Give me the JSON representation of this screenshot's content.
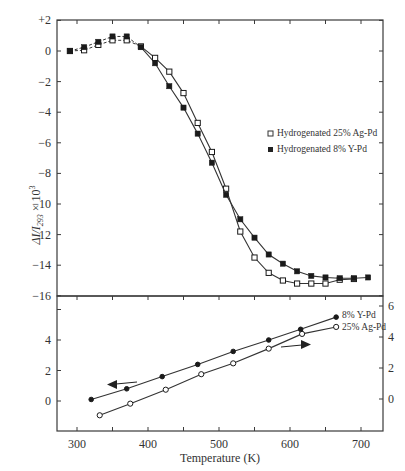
{
  "chart_data": [
    {
      "type": "line",
      "panel": "upper",
      "title": "",
      "xlabel": "Temperature (K)",
      "ylabel": "ΔI/I293 × 10^3",
      "ylim": [
        -16,
        2
      ],
      "xlim": [
        270,
        730
      ],
      "yticks": [
        "+2",
        "0",
        "−2",
        "−4",
        "−6",
        "−8",
        "−10",
        "−12",
        "−14",
        "−16"
      ],
      "ytick_values": [
        2,
        0,
        -2,
        -4,
        -6,
        -8,
        -10,
        -12,
        -14,
        -16
      ],
      "legend": {
        "position": "right-middle",
        "entries": [
          {
            "marker": "open-square",
            "label": "Hydrogenated  25% Ag-Pd"
          },
          {
            "marker": "filled-square",
            "label": "Hydrogenated   8% Y-Pd"
          }
        ]
      },
      "series": [
        {
          "name": "Hydrogenated 25% Ag-Pd",
          "marker": "open-square",
          "x": [
            290,
            310,
            330,
            350,
            370,
            390,
            410,
            430,
            450,
            470,
            490,
            510,
            530,
            550,
            570,
            590,
            610,
            630,
            650,
            670,
            690
          ],
          "y": [
            0.0,
            0.05,
            0.4,
            0.7,
            0.7,
            0.3,
            -0.45,
            -1.35,
            -2.75,
            -4.7,
            -6.6,
            -9.0,
            -11.8,
            -13.5,
            -14.5,
            -15.0,
            -15.2,
            -15.2,
            -15.2,
            -14.95,
            -14.9
          ],
          "dashed_until_x": 390
        },
        {
          "name": "Hydrogenated 8% Y-Pd",
          "marker": "filled-square",
          "x": [
            290,
            310,
            330,
            350,
            370,
            390,
            410,
            430,
            450,
            470,
            490,
            510,
            530,
            550,
            570,
            590,
            610,
            630,
            650,
            670,
            690,
            710
          ],
          "y": [
            0.0,
            0.25,
            0.6,
            0.95,
            0.95,
            0.25,
            -0.8,
            -2.3,
            -3.7,
            -5.4,
            -7.3,
            -9.4,
            -11.0,
            -12.2,
            -13.3,
            -13.9,
            -14.4,
            -14.7,
            -14.8,
            -14.85,
            -14.85,
            -14.8
          ],
          "dashed_until_x": 390
        }
      ]
    },
    {
      "type": "line",
      "panel": "lower",
      "xlabel": "Temperature (K)",
      "xticks": [
        "300",
        "400",
        "500",
        "600",
        "700"
      ],
      "xtick_values": [
        300,
        400,
        500,
        600,
        700
      ],
      "xlim": [
        270,
        730
      ],
      "left_yticks": [
        "0",
        "2",
        "4"
      ],
      "left_ytick_values": [
        0,
        2,
        4
      ],
      "right_yticks": [
        "0",
        "2",
        "4",
        "6"
      ],
      "right_ytick_values": [
        0,
        2,
        4,
        6
      ],
      "ylim_left": [
        -1.9,
        6.4
      ],
      "ylim_right": [
        -1.9,
        6.4
      ],
      "annotations": [
        {
          "text": "8% Y-Pd",
          "position": "end of upper line"
        },
        {
          "text": "25% Ag-Pd",
          "position": "end of lower line"
        },
        {
          "type": "arrow",
          "direction": "left",
          "near_series": "8% Y-Pd",
          "meaning": "cooling (left axis)"
        },
        {
          "type": "arrow",
          "direction": "right",
          "near_series": "25% Ag-Pd",
          "meaning": "heating (right axis)"
        }
      ],
      "series": [
        {
          "name": "8% Y-Pd",
          "marker": "filled-circle",
          "axis": "left",
          "x": [
            320,
            370,
            420,
            470,
            520,
            570,
            615,
            665
          ],
          "y": [
            0.1,
            0.8,
            1.6,
            2.4,
            3.25,
            4.0,
            4.7,
            5.5
          ]
        },
        {
          "name": "25% Ag-Pd",
          "marker": "open-circle",
          "axis": "right",
          "x": [
            332,
            375,
            425,
            475,
            520,
            570,
            617,
            665
          ],
          "y": [
            -1.05,
            -0.3,
            0.6,
            1.6,
            2.3,
            3.25,
            4.2,
            4.65
          ]
        }
      ]
    }
  ],
  "labels": {
    "upper_ylabel_main": "ΔI/I",
    "upper_ylabel_sub": "293",
    "upper_ylabel_tail": " × 10",
    "upper_ylabel_sup": "3",
    "xlabel": "Temperature (K)",
    "legend_ag": "Hydrogenated  25% Ag-Pd",
    "legend_y": "Hydrogenated   8% Y-Pd",
    "annot_y": "8% Y-Pd",
    "annot_ag": "25% Ag-Pd"
  }
}
